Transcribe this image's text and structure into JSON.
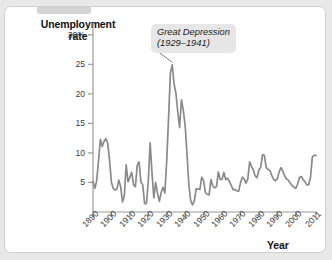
{
  "figure": {
    "background_color": "#ffffff",
    "page_color": "#e8e8e8",
    "line_color": "#8a8a8a",
    "axis_color": "#9a9a9a",
    "callout_bg": "#e6e6e6"
  },
  "labels": {
    "ylabel_line1": "Unemployment",
    "ylabel_line2": "rate",
    "xlabel": "Year",
    "annotation_line1": "Great Depression",
    "annotation_line2": "(1929–1941)"
  },
  "chart_data": {
    "type": "line",
    "title": "",
    "xlabel": "Year",
    "ylabel": "Unemployment rate",
    "grid": false,
    "legend": "none",
    "xlim": [
      1890,
      2011
    ],
    "ylim": [
      0,
      32
    ],
    "ytick_labels": [
      "30%",
      "25",
      "20",
      "15",
      "10",
      "5"
    ],
    "ytick_values": [
      30,
      25,
      20,
      15,
      10,
      5
    ],
    "xtick_labels": [
      "1890",
      "1900",
      "1910",
      "1920",
      "1930",
      "1940",
      "1950",
      "1960",
      "1970",
      "1980",
      "1990",
      "2000",
      "2011"
    ],
    "xtick_values": [
      1890,
      1900,
      1910,
      1920,
      1930,
      1940,
      1950,
      1960,
      1970,
      1980,
      1990,
      2000,
      2011
    ],
    "annotations": [
      {
        "text": "Great Depression (1929–1941)",
        "points_to_year": 1933,
        "points_to_value": 25.0
      }
    ],
    "x": [
      1890,
      1891,
      1892,
      1893,
      1894,
      1895,
      1896,
      1897,
      1898,
      1899,
      1900,
      1901,
      1902,
      1903,
      1904,
      1905,
      1906,
      1907,
      1908,
      1909,
      1910,
      1911,
      1912,
      1913,
      1914,
      1915,
      1916,
      1917,
      1918,
      1919,
      1920,
      1921,
      1922,
      1923,
      1924,
      1925,
      1926,
      1927,
      1928,
      1929,
      1930,
      1931,
      1932,
      1933,
      1934,
      1935,
      1936,
      1937,
      1938,
      1939,
      1940,
      1941,
      1942,
      1943,
      1944,
      1945,
      1946,
      1947,
      1948,
      1949,
      1950,
      1951,
      1952,
      1953,
      1954,
      1955,
      1956,
      1957,
      1958,
      1959,
      1960,
      1961,
      1962,
      1963,
      1964,
      1965,
      1966,
      1967,
      1968,
      1969,
      1970,
      1971,
      1972,
      1973,
      1974,
      1975,
      1976,
      1977,
      1978,
      1979,
      1980,
      1981,
      1982,
      1983,
      1984,
      1985,
      1986,
      1987,
      1988,
      1989,
      1990,
      1991,
      1992,
      1993,
      1994,
      1995,
      1996,
      1997,
      1998,
      1999,
      2000,
      2001,
      2002,
      2003,
      2004,
      2005,
      2006,
      2007,
      2008,
      2009,
      2010,
      2011
    ],
    "y": [
      5.2,
      4.0,
      5.3,
      8.7,
      12.3,
      11.1,
      12.0,
      12.4,
      11.6,
      8.7,
      5.0,
      4.0,
      3.7,
      3.9,
      5.4,
      4.3,
      1.7,
      2.8,
      8.0,
      5.1,
      5.9,
      6.7,
      4.6,
      4.3,
      7.9,
      8.5,
      5.1,
      4.6,
      1.4,
      1.4,
      5.2,
      11.7,
      6.7,
      2.4,
      5.0,
      3.2,
      1.8,
      3.3,
      4.2,
      3.2,
      8.7,
      15.9,
      23.6,
      24.9,
      21.7,
      20.1,
      16.9,
      14.3,
      19.0,
      17.2,
      14.6,
      9.9,
      4.7,
      1.9,
      1.2,
      1.9,
      3.9,
      3.9,
      3.8,
      5.9,
      5.3,
      3.3,
      3.0,
      2.9,
      5.5,
      4.4,
      4.1,
      4.3,
      6.8,
      5.5,
      5.5,
      6.7,
      5.5,
      5.7,
      5.2,
      4.5,
      3.8,
      3.8,
      3.6,
      3.5,
      4.9,
      5.9,
      5.6,
      4.9,
      5.6,
      8.5,
      7.7,
      7.1,
      6.1,
      5.8,
      7.1,
      7.6,
      9.7,
      9.6,
      7.5,
      7.2,
      7.0,
      6.2,
      5.5,
      5.3,
      5.6,
      6.8,
      7.5,
      6.9,
      6.1,
      5.6,
      5.4,
      4.9,
      4.5,
      4.2,
      4.0,
      4.7,
      5.8,
      6.0,
      5.5,
      5.1,
      4.6,
      4.6,
      5.8,
      9.3,
      9.6,
      9.6
    ]
  }
}
